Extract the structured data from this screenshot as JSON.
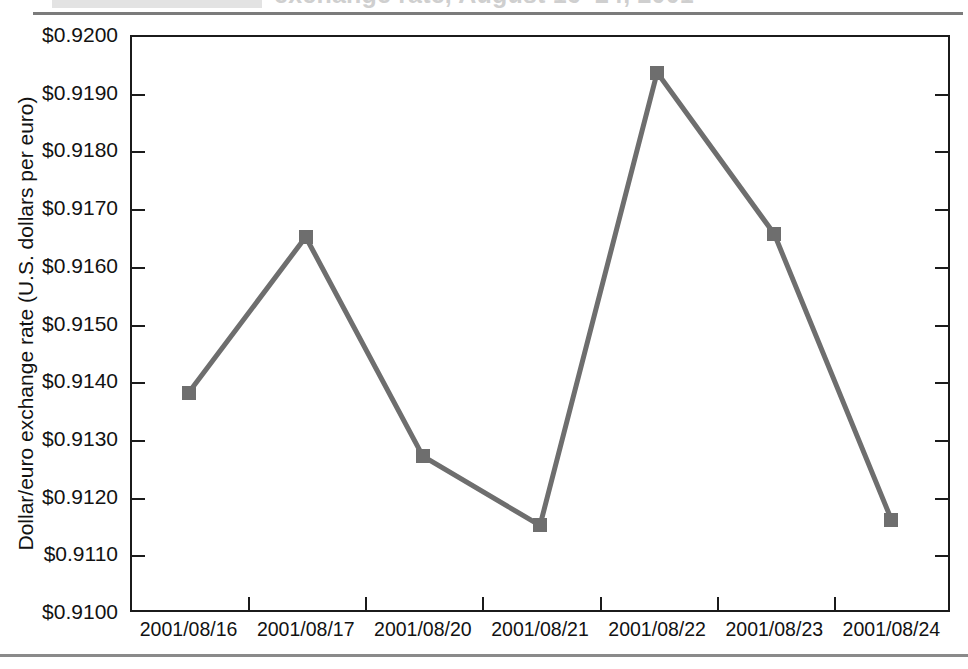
{
  "page": {
    "title_partial": "exchange rate, August 16–24, 2001",
    "background_color": "#ffffff"
  },
  "chart_data": {
    "type": "line",
    "title": "exchange rate, August 16–24, 2001",
    "xlabel": "",
    "ylabel": "Dollar/euro exchange rate (U.S. dollars per euro)",
    "categories": [
      "2001/08/16",
      "2001/08/17",
      "2001/08/20",
      "2001/08/21",
      "2001/08/22",
      "2001/08/23",
      "2001/08/24"
    ],
    "values": [
      0.9138,
      0.9165,
      0.9127,
      0.9115,
      0.91935,
      0.91655,
      0.9116
    ],
    "value_labels": [
      "$0.9138",
      "$0.9165",
      "$0.9127",
      "$0.9115",
      "$0.91935",
      "$0.91655",
      "$0.9116"
    ],
    "ylim": [
      0.91,
      0.92
    ],
    "ytick_step": 0.001,
    "ytick_labels": [
      "$0.9200",
      "$0.9190",
      "$0.9180",
      "$0.9170",
      "$0.9160",
      "$0.9150",
      "$0.9140",
      "$0.9130",
      "$0.9120",
      "$0.9110",
      "$0.9100"
    ],
    "ytick_values": [
      0.92,
      0.919,
      0.918,
      0.917,
      0.916,
      0.915,
      0.914,
      0.913,
      0.912,
      0.911,
      0.91
    ],
    "grid": false,
    "legend": null,
    "legend_position": "none",
    "series_color": "#6e6e6e",
    "marker_shape": "square",
    "axis_color": "#1b1b1b",
    "rule_color": "#7b7b7b"
  }
}
